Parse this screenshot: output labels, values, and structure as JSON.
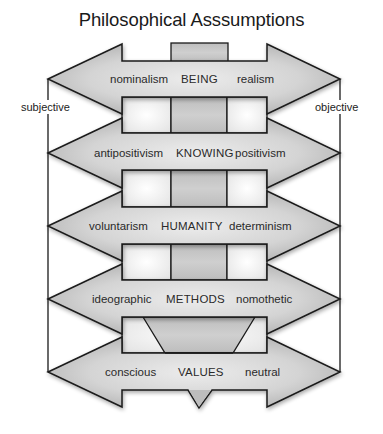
{
  "title": "Philosophical Asssumptions",
  "axis": {
    "left_label": "subjective",
    "right_label": "objective"
  },
  "rows": [
    {
      "left": "nominalism",
      "center": "BEING",
      "right": "realism"
    },
    {
      "left": "antipositivism",
      "center": "KNOWING",
      "right": "positivism"
    },
    {
      "left": "voluntarism",
      "center": "HUMANITY",
      "right": "determinism"
    },
    {
      "left": "ideographic",
      "center": "METHODS",
      "right": "nomothetic"
    },
    {
      "left": "conscious",
      "center": "VALUES",
      "right": "neutral"
    }
  ],
  "colors": {
    "stroke": "#1a1a1a",
    "arrow_fill_edge": "#b4b4b4",
    "arrow_fill_center": "#e6e6e6",
    "center_box_fill": "#c2c2c2",
    "side_box_fill": "#f7f7f7"
  }
}
